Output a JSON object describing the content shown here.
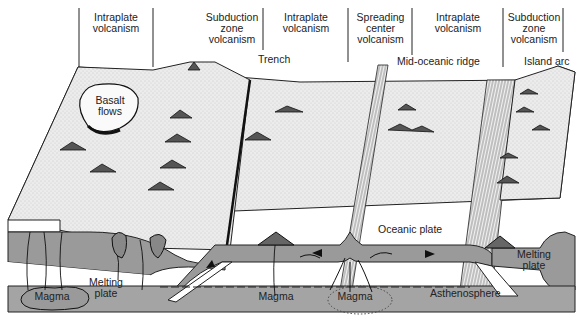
{
  "diagram": {
    "type": "geologic block diagram",
    "zone_headers": [
      {
        "id": "intraplate-1",
        "label": "Intraplate\nvolcanism"
      },
      {
        "id": "subduction-1",
        "label": "Subduction\nzone\nvolcanism"
      },
      {
        "id": "intraplate-2",
        "label": "Intraplate\nvolcanism"
      },
      {
        "id": "spreading",
        "label": "Spreading\ncenter\nvolcanism"
      },
      {
        "id": "intraplate-3",
        "label": "Intraplate\nvolcanism"
      },
      {
        "id": "subduction-2",
        "label": "Subduction\nzone\nvolcanism"
      }
    ],
    "callouts": {
      "trench": "Trench",
      "mid_oceanic_ridge": "Mid-oceanic ridge",
      "island_arc": "Island arc",
      "basalt_flows": "Basalt\nflows",
      "oceanic_plate": "Oceanic plate",
      "melting_plate_left": "Melting\nplate",
      "melting_plate_right": "Melting\nplate",
      "magma_left": "Magma",
      "magma_mid": "Magma",
      "magma_ridge": "Magma",
      "asthenosphere": "Asthenosphere"
    },
    "colors": {
      "plate_gray": "#9a9a9a",
      "asthenosphere_gray": "#a4a4a4",
      "surface_light": "#e8e8e8",
      "ink": "#1a1a1a",
      "background": "#ffffff"
    }
  }
}
